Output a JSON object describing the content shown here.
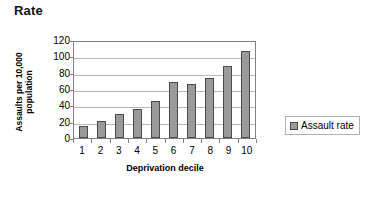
{
  "title": "Rate",
  "chart_data": {
    "type": "bar",
    "title": "Rate",
    "xlabel": "Deprivation decile",
    "ylabel": "Assaults per 10,000\npopulation",
    "categories": [
      "1",
      "2",
      "3",
      "4",
      "5",
      "6",
      "7",
      "8",
      "9",
      "10"
    ],
    "values": [
      15,
      21,
      30,
      35,
      45,
      68,
      66,
      73,
      88,
      107
    ],
    "series": [
      {
        "name": "Assault rate",
        "values": [
          15,
          21,
          30,
          35,
          45,
          68,
          66,
          73,
          88,
          107
        ]
      }
    ],
    "ylim": [
      0,
      120
    ],
    "yticks": [
      0,
      20,
      40,
      60,
      80,
      100,
      120
    ],
    "ytick_labels": [
      "0",
      "20",
      "40",
      "60",
      "80",
      "100",
      "120"
    ],
    "grid": true,
    "grid_axis": "y",
    "legend": {
      "position": "right",
      "entries": [
        {
          "label": "Assault rate",
          "color": "#9a9a9a"
        }
      ]
    },
    "colors": {
      "bar_fill": "#9a9a9a",
      "bar_border": "#4a4a4a",
      "gridline": "#b9b9b9",
      "axis": "#808080",
      "text": "#000000",
      "background": "#ffffff"
    }
  }
}
